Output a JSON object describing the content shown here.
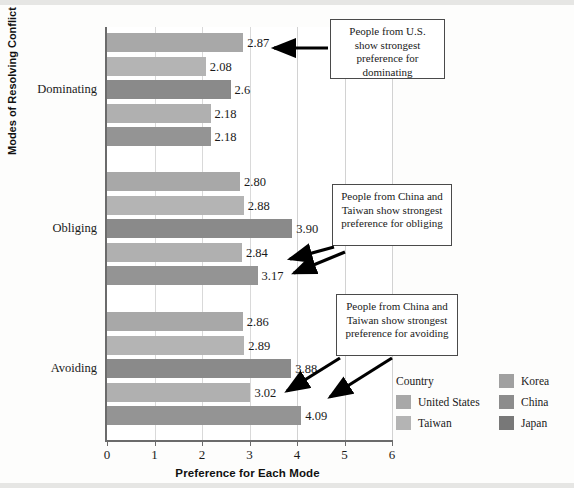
{
  "chart_data": {
    "type": "bar",
    "orientation": "horizontal",
    "title": "",
    "xlabel": "Preference for Each Mode",
    "ylabel": "Modes of Resolving Conflict",
    "xlim": [
      0,
      6
    ],
    "xticks": [
      "0",
      "1",
      "2",
      "3",
      "4",
      "5",
      "6"
    ],
    "grid": true,
    "categories": [
      "Dominating",
      "Obliging",
      "Avoiding"
    ],
    "legend_title": "Country",
    "legend_position": "bottom-right",
    "series": [
      {
        "name": "United States",
        "color": "#a8a8a8",
        "values": [
          2.87,
          2.8,
          2.86
        ],
        "labels": [
          "2.87",
          "2.80",
          "2.86"
        ]
      },
      {
        "name": "Taiwan",
        "color": "#b4b4b4",
        "values": [
          2.08,
          2.88,
          2.89
        ],
        "labels": [
          "2.08",
          "2.88",
          "2.89"
        ]
      },
      {
        "name": "Korea",
        "color": "#8a8a8a",
        "values": [
          2.6,
          3.9,
          3.88
        ],
        "labels": [
          "2.6",
          "3.90",
          "3.88"
        ]
      },
      {
        "name": "China",
        "color": "#b0b0b0",
        "values": [
          2.18,
          2.84,
          3.02
        ],
        "labels": [
          "2.18",
          "2.84",
          "3.02"
        ]
      },
      {
        "name": "Japan",
        "color": "#949494",
        "values": [
          2.18,
          3.17,
          4.09
        ],
        "labels": [
          "2.18",
          "3.17",
          "4.09"
        ]
      }
    ],
    "annotations": [
      {
        "text": "People from U.S. show strongest preference for dominating",
        "target": "Dominating / United States"
      },
      {
        "text": "People from China and Taiwan show strongest preference for obliging",
        "target": "Obliging / China, Japan"
      },
      {
        "text": "People from China and Taiwan show strongest preference for avoiding",
        "target": "Avoiding / China, Japan"
      }
    ]
  },
  "legend": {
    "title": "Country",
    "column_left": [
      {
        "label": "United States",
        "color": "#a8a8a8"
      },
      {
        "label": "Taiwan",
        "color": "#b4b4b4"
      }
    ],
    "column_right": [
      {
        "label": "Korea",
        "color": "#a0a0a0"
      },
      {
        "label": "China",
        "color": "#8c8c8c"
      },
      {
        "label": "Japan",
        "color": "#787878"
      }
    ]
  },
  "annotations": {
    "a1": "People from U.S. show strongest preference for dominating",
    "a2": "People from China and Taiwan show strongest preference for obliging",
    "a3": "People from China and Taiwan show strongest preference for avoiding"
  }
}
